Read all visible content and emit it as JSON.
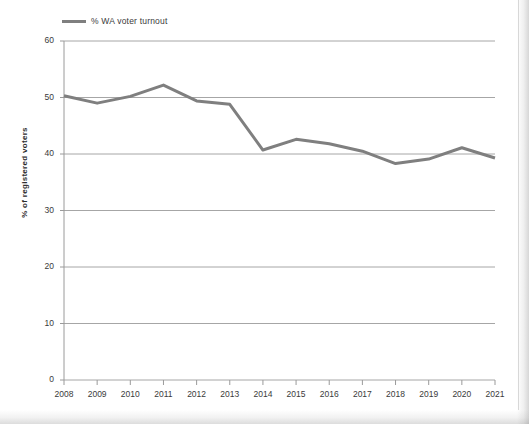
{
  "legend": {
    "series_label": "% WA voter turnout",
    "swatch_color": "#7f7f7f"
  },
  "axes": {
    "y_title": "% of registered voters",
    "y_ticks": [
      "0",
      "10",
      "20",
      "30",
      "40",
      "50",
      "60"
    ],
    "x_ticks": [
      "2008",
      "2009",
      "2010",
      "2011",
      "2012",
      "2013",
      "2014",
      "2015",
      "2016",
      "2017",
      "2018",
      "2019",
      "2020",
      "2021"
    ]
  },
  "chart_data": {
    "type": "line",
    "title": "",
    "subtitle": "",
    "xlabel": "",
    "ylabel": "% of registered voters",
    "ylim": [
      0,
      60
    ],
    "ytick_step": 10,
    "grid": true,
    "grid_axis": "y",
    "legend_position": "top-left",
    "line_color": "#7f7f7f",
    "line_width": 3,
    "markers": false,
    "categories": [
      "2008",
      "2009",
      "2010",
      "2011",
      "2012",
      "2013",
      "2014",
      "2015",
      "2016",
      "2017",
      "2018",
      "2019",
      "2020",
      "2021"
    ],
    "series": [
      {
        "name": "% WA voter turnout",
        "values": [
          50.3,
          49.0,
          50.2,
          52.2,
          49.4,
          48.8,
          40.7,
          42.6,
          41.8,
          40.5,
          38.3,
          39.1,
          41.1,
          39.3
        ]
      }
    ]
  }
}
